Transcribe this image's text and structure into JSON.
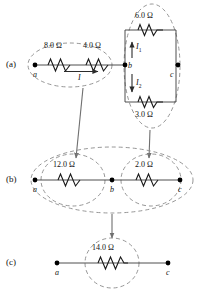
{
  "figure": {
    "wire_color": "#3a3a3a",
    "node_color": "#000000",
    "dash_color": "#8a8a8a",
    "arrow_color": "#6f6f6f",
    "omega": "Ω"
  },
  "rows": [
    {
      "key": "a",
      "label": "(a)",
      "nodes": [
        {
          "name": "a",
          "label": "a"
        },
        {
          "name": "b",
          "label": "b"
        },
        {
          "name": "c",
          "label": "c"
        }
      ],
      "resistors": [
        {
          "name": "r-8",
          "value": "8.0 Ω"
        },
        {
          "name": "r-4",
          "value": "4.0 Ω"
        },
        {
          "name": "r-6",
          "value": "6.0 Ω"
        },
        {
          "name": "r-3",
          "value": "3.0 Ω"
        }
      ],
      "currents": [
        {
          "name": "I",
          "label": "I",
          "sub": "",
          "direction": "right"
        },
        {
          "name": "I1",
          "label": "I",
          "sub": "1",
          "direction": "up"
        },
        {
          "name": "I2",
          "label": "I",
          "sub": "2",
          "direction": "down"
        }
      ]
    },
    {
      "key": "b",
      "label": "(b)",
      "nodes": [
        {
          "name": "a",
          "label": "a"
        },
        {
          "name": "b",
          "label": "b"
        },
        {
          "name": "c",
          "label": "c"
        }
      ],
      "resistors": [
        {
          "name": "r-12",
          "value": "12.0 Ω"
        },
        {
          "name": "r-2",
          "value": "2.0 Ω"
        }
      ]
    },
    {
      "key": "c",
      "label": "(c)",
      "nodes": [
        {
          "name": "a",
          "label": "a"
        },
        {
          "name": "c",
          "label": "c"
        }
      ],
      "resistors": [
        {
          "name": "r-14",
          "value": "14.0 Ω"
        }
      ]
    }
  ]
}
